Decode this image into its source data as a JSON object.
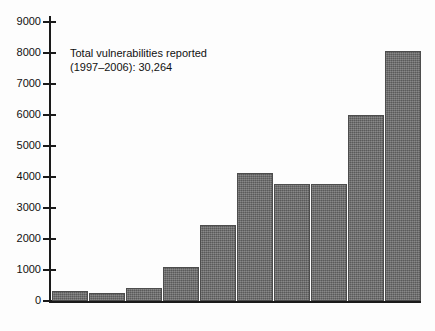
{
  "chart_data": {
    "type": "bar",
    "title": "",
    "subtitle": "",
    "xlabel": "",
    "ylabel": "",
    "categories": [
      "1997",
      "1998",
      "1999",
      "2000",
      "2001",
      "2002",
      "2003",
      "2004",
      "2005",
      "2006"
    ],
    "values": [
      311,
      262,
      417,
      1090,
      2437,
      4129,
      3784,
      3780,
      5990,
      8064
    ],
    "value_labels": [
      "311",
      "262",
      "417",
      "1090",
      "2437",
      "4129",
      "3784",
      "3780",
      "5990",
      "8064"
    ],
    "ylim": [
      0,
      9000
    ],
    "y_ticks": [
      0,
      1000,
      2000,
      3000,
      4000,
      5000,
      6000,
      7000,
      8000,
      9000
    ],
    "y_tick_labels": [
      "0",
      "1000",
      "2000",
      "3000",
      "4000",
      "5000",
      "6000",
      "7000",
      "8000",
      "9000"
    ],
    "grid": false,
    "legend": null,
    "bar_color": "#6e6e6e",
    "axis_color": "#1a1a1a",
    "text_color": "#111111",
    "background_color": "#fdfdfd",
    "annotations": [
      {
        "line1": "Total vulnerabilities reported",
        "line2": "(1997–2006): 30,264"
      }
    ]
  }
}
